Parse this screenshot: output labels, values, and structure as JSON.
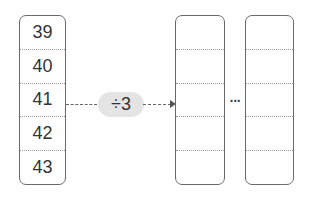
{
  "input_column": {
    "values": [
      "39",
      "40",
      "41",
      "42",
      "43"
    ]
  },
  "operation": {
    "label": "÷3"
  },
  "output_columns": [
    {
      "values": [
        "",
        "",
        "",
        "",
        ""
      ]
    },
    {
      "values": [
        "",
        "",
        "",
        "",
        ""
      ]
    }
  ],
  "ellipsis": "···"
}
